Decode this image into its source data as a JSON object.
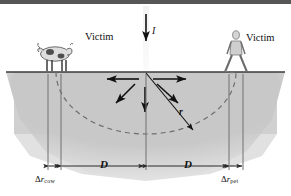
{
  "figure": {
    "ground_line_y": 72,
    "strike_point": {
      "x": 146,
      "y": 72
    },
    "colors": {
      "soil": "#c9c9c9",
      "ground_line": "#3a3a3a",
      "arrow": "#111111",
      "dashed_arc": "#6d6d6d",
      "top_bar": "#565656",
      "text": "#111111",
      "dimension_line": "#2b2b2b",
      "cow_body": "#d8d8d8",
      "person_body": "#cfcfcf"
    },
    "labels": {
      "current": "I",
      "radius": "r",
      "victim_left": "Victim",
      "victim_right": "Victim",
      "distance_left": "D",
      "distance_right": "D",
      "delta_r_cow_symbol": "Δ",
      "delta_r_cow_var": "r",
      "delta_r_cow_sub": "cow",
      "delta_r_pet_symbol": "Δ",
      "delta_r_pet_var": "r",
      "delta_r_pet_sub": "pet"
    },
    "elements": {
      "current_arrow": "downward vertical arrow into strike point",
      "radial_arrows": "six arrows radiating outward from strike point",
      "dashed_arc": "dashed semicircular equipotential of radius r",
      "radius_line": "solid line from strike point to arc labeled r",
      "cow_figure": "cow standing on ground at left",
      "person_figure": "person standing with legs apart at right"
    }
  }
}
